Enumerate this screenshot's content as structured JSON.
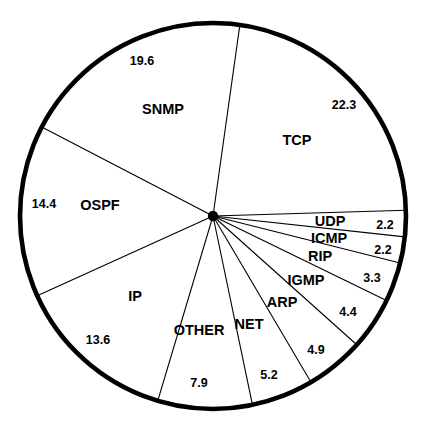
{
  "chart_data": {
    "type": "pie",
    "title": "",
    "subtitle": "",
    "xlabel": "",
    "ylabel": "",
    "legend": "none",
    "grid": false,
    "units": "percent",
    "total": 100.0,
    "start_angle_deg": 8,
    "direction": "clockwise",
    "categories": [
      "TCP",
      "UDP",
      "ICMP",
      "RIP",
      "IGMP",
      "ARP",
      "NET",
      "OTHER",
      "IP",
      "OSPF",
      "SNMP"
    ],
    "values": [
      22.3,
      2.2,
      2.2,
      3.3,
      4.4,
      4.9,
      5.2,
      7.9,
      13.6,
      14.4,
      19.6
    ],
    "slices": [
      {
        "label": "TCP",
        "value": "22.3",
        "label_x": 297,
        "label_y": 141,
        "value_x": 344,
        "value_y": 106
      },
      {
        "label": "UDP",
        "value": "2.2",
        "label_x": 330,
        "label_y": 222,
        "value_x": 385,
        "value_y": 226
      },
      {
        "label": "ICMP",
        "value": "2.2",
        "label_x": 329,
        "label_y": 239,
        "value_x": 383,
        "value_y": 251
      },
      {
        "label": "RIP",
        "value": "3.3",
        "label_x": 320,
        "label_y": 257,
        "value_x": 372,
        "value_y": 279
      },
      {
        "label": "IGMP",
        "value": "4.4",
        "label_x": 306,
        "label_y": 281,
        "value_x": 348,
        "value_y": 313
      },
      {
        "label": "ARP",
        "value": "4.9",
        "label_x": 282,
        "label_y": 303,
        "value_x": 316,
        "value_y": 351
      },
      {
        "label": "NET",
        "value": "5.2",
        "label_x": 249,
        "label_y": 325,
        "value_x": 269,
        "value_y": 376
      },
      {
        "label": "OTHER",
        "value": "7.9",
        "label_x": 199,
        "label_y": 331,
        "value_x": 199,
        "value_y": 384
      },
      {
        "label": "IP",
        "value": "13.6",
        "label_x": 135,
        "label_y": 297,
        "value_x": 98,
        "value_y": 341
      },
      {
        "label": "OSPF",
        "value": "14.4",
        "label_x": 100,
        "label_y": 206,
        "value_x": 44,
        "value_y": 205
      },
      {
        "label": "SNMP",
        "value": "19.6",
        "label_x": 163,
        "label_y": 110,
        "value_x": 142,
        "value_y": 62
      }
    ],
    "geometry": {
      "center_x": 213,
      "center_y": 216,
      "radius": 193
    }
  }
}
